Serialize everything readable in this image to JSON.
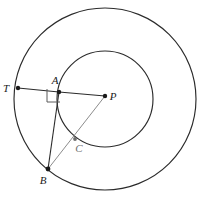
{
  "figure": {
    "background_color": "#ffffff",
    "stroke_color": "#2b2b2b",
    "faint_stroke_color": "#8c8c8c",
    "point_color": "#1a1a1a",
    "width": 199,
    "height": 203
  },
  "labels": {
    "T": "T",
    "A": "A",
    "P": "P",
    "B": "B",
    "C": "C"
  },
  "points": [
    {
      "name": "T",
      "label": "T",
      "x": 18,
      "y": 88,
      "label_x": 6,
      "label_y": 88,
      "faint": false
    },
    {
      "name": "A",
      "label": "A",
      "x": 59,
      "y": 92,
      "label_x": 52,
      "label_y": 82,
      "faint": false
    },
    {
      "name": "P",
      "label": "P",
      "x": 105,
      "y": 96,
      "label_x": 110,
      "label_y": 98,
      "faint": false
    },
    {
      "name": "B",
      "label": "B",
      "x": 48,
      "y": 169,
      "label_x": 40,
      "label_y": 183,
      "faint": false
    },
    {
      "name": "C",
      "label": "C",
      "x": 75,
      "y": 139,
      "label_x": 76,
      "label_y": 151,
      "faint": true
    }
  ],
  "circles": [
    {
      "name": "outer-circle",
      "cx": 105,
      "cy": 99,
      "r": 91
    },
    {
      "name": "inner-circle",
      "cx": 105,
      "cy": 99,
      "r": 48
    }
  ],
  "segments": [
    {
      "name": "segment-tangent-TA",
      "x1": 18,
      "y1": 88,
      "x2": 59,
      "y2": 92,
      "faint": false
    },
    {
      "name": "segment-radius-AP",
      "x1": 59,
      "y1": 92,
      "x2": 105,
      "y2": 96,
      "faint": false
    },
    {
      "name": "segment-chord-AB",
      "x1": 59,
      "y1": 92,
      "x2": 48,
      "y2": 169,
      "faint": false
    },
    {
      "name": "segment-BP",
      "x1": 48,
      "y1": 169,
      "x2": 105,
      "y2": 96,
      "faint": true
    }
  ],
  "right_angle_marker": {
    "name": "right-angle-at-A",
    "points": "47,89 47,102 60,102",
    "vertex": "A"
  }
}
